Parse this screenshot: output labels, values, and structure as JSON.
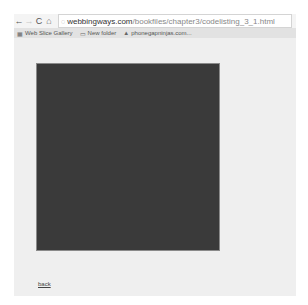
{
  "browser": {
    "nav": {
      "back_icon": "←",
      "forward_icon": "→",
      "reload_icon": "C",
      "home_icon": "⌂"
    },
    "omnibox": {
      "page_icon": "◌",
      "url_host": "webbingways.com",
      "url_path": "/bookfiles/chapter3/codelisting_3_1.html"
    },
    "bookmarks": [
      {
        "icon": "▦",
        "label": "Web Slice Gallery"
      },
      {
        "icon": "▭",
        "label": "New folder"
      },
      {
        "icon": "▲",
        "label": "phonegapninjas.com..."
      }
    ]
  },
  "page": {
    "canvas_color": "#3a3a3a",
    "back_link": "back"
  }
}
